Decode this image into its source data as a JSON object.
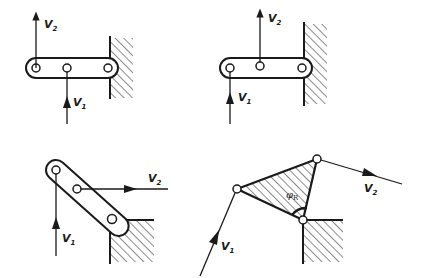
{
  "figure": {
    "panels": [
      {
        "id": "a",
        "description": "Straight link with three pins, pinned against wall on right; V2 up at left pin, V1 up at middle pin",
        "labels": {
          "v1": "V",
          "v1_sub": "1",
          "v2": "V",
          "v2_sub": "2"
        }
      },
      {
        "id": "b",
        "description": "Straight link with three pins against wall; V1 up at left pin, V2 up at middle pin",
        "labels": {
          "v1": "V",
          "v1_sub": "1",
          "v2": "V",
          "v2_sub": "2"
        }
      },
      {
        "id": "c",
        "description": "Inclined link resting on ground corner; V1 vertical at top pin, V2 horizontal at middle pin",
        "labels": {
          "v1": "V",
          "v1_sub": "1",
          "v2": "V",
          "v2_sub": "2"
        }
      },
      {
        "id": "d",
        "description": "Triangular plate pinned at ground corner with angle phi_R; V1 inclined into left vertex, V2 out of top vertex",
        "labels": {
          "v1": "V",
          "v1_sub": "1",
          "v2": "V",
          "v2_sub": "2",
          "angle": "φ",
          "angle_sub": "R"
        }
      }
    ],
    "colors": {
      "ink": "#1a1a1a",
      "background": "#ffffff"
    }
  }
}
